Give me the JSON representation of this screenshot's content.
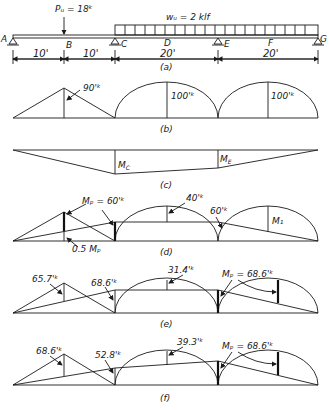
{
  "panel_a": {
    "point_load": "Pᵤ = 18ᵏ",
    "distributed_load": "wᵤ = 2 klf",
    "nodes": [
      "A",
      "B",
      "C",
      "D",
      "E",
      "F",
      "G"
    ],
    "dims": [
      "10'",
      "10'",
      "20'",
      "20'"
    ],
    "caption": "(a)"
  },
  "panel_b": {
    "labels": [
      "90'ᵏ",
      "100'ᵏ",
      "100'ᵏ"
    ],
    "caption": "(b)"
  },
  "panel_c": {
    "labels": [
      "M_C",
      "M_E"
    ],
    "mc": "M",
    "mc_sub": "C",
    "me": "M",
    "me_sub": "E",
    "caption": "(c)"
  },
  "panel_d": {
    "mp_label": "Mₚ = 60'ᵏ",
    "half_mp": "0.5 Mₚ",
    "label_40": "40'ᵏ",
    "label_60": "60'ᵏ",
    "m1": "M₁",
    "caption": "(d)"
  },
  "panel_e": {
    "l1": "65.7'ᵏ",
    "l2": "68.6'ᵏ",
    "l3": "31.4'ᵏ",
    "l4": "Mₚ = 68.6'ᵏ",
    "caption": "(e)"
  },
  "panel_f": {
    "l1": "68.6'ᵏ",
    "l2": "52.8'ᵏ",
    "l3": "39.3'ᵏ",
    "l4": "Mₚ = 68.6'ᵏ",
    "caption": "(f)"
  }
}
